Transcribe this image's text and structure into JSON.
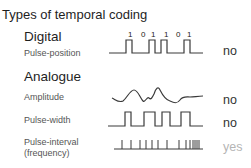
{
  "title": "Types of temporal coding",
  "sections": {
    "digital": {
      "heading": "Digital",
      "rows": [
        {
          "label": "Pulse-position",
          "bits": [
            "1",
            "0",
            "1",
            "1",
            "0",
            "1"
          ],
          "verdict": "no"
        }
      ]
    },
    "analogue": {
      "heading": "Analogue",
      "rows": [
        {
          "label": "Amplitude",
          "verdict": "no"
        },
        {
          "label": "Pulse-width",
          "verdict": "no"
        },
        {
          "label_line1": "Pulse-interval",
          "label_line2": "(frequency)",
          "verdict": "yes"
        }
      ]
    }
  },
  "colors": {
    "signal": "#3a3a3a",
    "verdict_no": "#333333",
    "verdict_yes": "#b5b5b5"
  }
}
